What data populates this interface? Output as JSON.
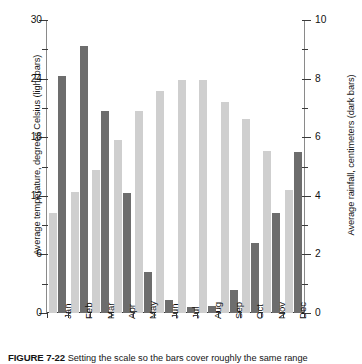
{
  "figure": {
    "caption_number": "FIGURE 7-22",
    "caption_text": "Setting the scale so the bars cover roughly the same range"
  },
  "axes": {
    "left": {
      "title": "Average temperature, degrees Celsius (light bars)",
      "tick_labels": [
        "0",
        "6",
        "12",
        "18",
        "24",
        "30"
      ],
      "major_ticks": [
        0,
        6,
        12,
        18,
        24,
        30
      ],
      "minor_ticks": [
        3,
        9,
        15,
        21,
        27
      ],
      "min": 0,
      "max": 30
    },
    "right": {
      "title": "Average rainfall, centimeters (dark bars)",
      "tick_labels": [
        "0",
        "2",
        "4",
        "6",
        "8",
        "10"
      ],
      "major_ticks": [
        0,
        2,
        4,
        6,
        8,
        10
      ],
      "minor_ticks": [
        1,
        3,
        5,
        7,
        9
      ],
      "min": 0,
      "max": 10
    }
  },
  "colors": {
    "light_bar": "#cfcfcf",
    "dark_bar": "#6d6d6d",
    "axis": "#3a3a3a",
    "background": "#ffffff"
  },
  "chart_data": {
    "type": "bar",
    "title": "",
    "subtitle": "",
    "xlabel": "",
    "ylabel": "Average temperature, degrees Celsius (light bars)",
    "y2label": "Average rainfall, centimeters (dark bars)",
    "ylim": [
      0,
      30
    ],
    "y2lim": [
      0,
      10
    ],
    "grid": false,
    "legend": "encoded in axis titles (light bars = temperature, dark bars = rainfall)",
    "categories": [
      "Jan",
      "Feb",
      "Mar",
      "Apr",
      "May",
      "Jun",
      "Jul",
      "Aug",
      "Sep",
      "Oct",
      "Nov",
      "Dec"
    ],
    "series": [
      {
        "name": "Average temperature (light bars)",
        "axis": "left",
        "unit": "degrees Celsius",
        "color": "#cfcfcf",
        "values": [
          10.2,
          12.4,
          14.6,
          17.7,
          20.7,
          22.7,
          23.9,
          23.9,
          21.6,
          19.9,
          16.6,
          12.6
        ]
      },
      {
        "name": "Average rainfall (dark bars)",
        "axis": "right",
        "unit": "centimeters",
        "color": "#6d6d6d",
        "values": [
          8.1,
          9.1,
          6.9,
          4.1,
          1.4,
          0.45,
          0.2,
          0.25,
          0.8,
          2.4,
          3.4,
          5.5
        ]
      }
    ]
  }
}
